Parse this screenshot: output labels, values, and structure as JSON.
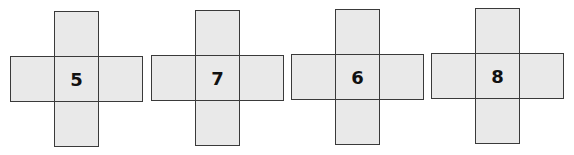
{
  "figure": {
    "colors": {
      "face_fill": "#e9e9e9",
      "edge": "#3a3a3a",
      "text": "#111111"
    },
    "nets": [
      {
        "label": "5"
      },
      {
        "label": "7"
      },
      {
        "label": "6"
      },
      {
        "label": "8"
      }
    ]
  }
}
